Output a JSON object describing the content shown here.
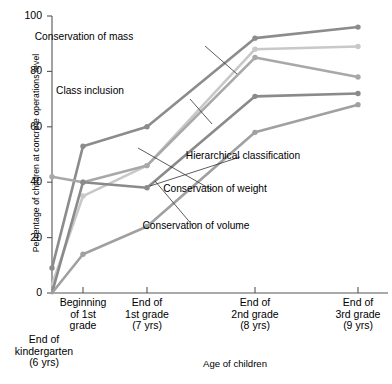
{
  "chart_data": {
    "type": "line",
    "title": "",
    "xlabel": "Age of children",
    "ylabel": "Percentage of children at concrete operations level",
    "ylim": [
      0,
      100
    ],
    "yticks": [
      0,
      20,
      40,
      60,
      80,
      100
    ],
    "grid": false,
    "legend_position": "inline-annotations",
    "categories": [
      "End of kindergarten (6 yrs)",
      "Beginning of 1st grade",
      "End of 1st grade (7 yrs)",
      "End of 2nd grade (8 yrs)",
      "End of 3rd grade (9 yrs)"
    ],
    "category_lines": [
      [
        "End of",
        "kindergarten",
        "(6 yrs)"
      ],
      [
        "Beginning",
        "of 1st",
        "grade"
      ],
      [
        "End of",
        "1st grade",
        "(7 yrs)"
      ],
      [
        "End of",
        "2nd grade",
        "(8 yrs)"
      ],
      [
        "End of",
        "3rd grade",
        "(9 yrs)"
      ]
    ],
    "series": [
      {
        "name": "Conservation of mass",
        "color": "#8c8c8c",
        "values": [
          9,
          53,
          60,
          92,
          96
        ]
      },
      {
        "name": "Class inclusion",
        "color": "#c8c8c8",
        "values": [
          3,
          35,
          46,
          88,
          89
        ]
      },
      {
        "name": "Hierarchical classification",
        "color": "#a8a8a8",
        "values": [
          42,
          40,
          46,
          85,
          78
        ]
      },
      {
        "name": "Conservation of weight",
        "color": "#8a8a8a",
        "values": [
          0,
          40,
          38,
          71,
          72
        ]
      },
      {
        "name": "Conservation of volume",
        "color": "#a0a0a0",
        "values": [
          0,
          14,
          24,
          58,
          68
        ]
      }
    ],
    "annotations": [
      {
        "text": "Conservation of mass",
        "x": 84,
        "y": 36
      },
      {
        "text": "Class inclusion",
        "x": 90,
        "y": 90
      },
      {
        "text": "Hierarchical classification",
        "x": 243,
        "y": 155
      },
      {
        "text": "Conservation of weight",
        "x": 215,
        "y": 188
      },
      {
        "text": "Conservation of volume",
        "x": 196,
        "y": 225
      }
    ]
  }
}
